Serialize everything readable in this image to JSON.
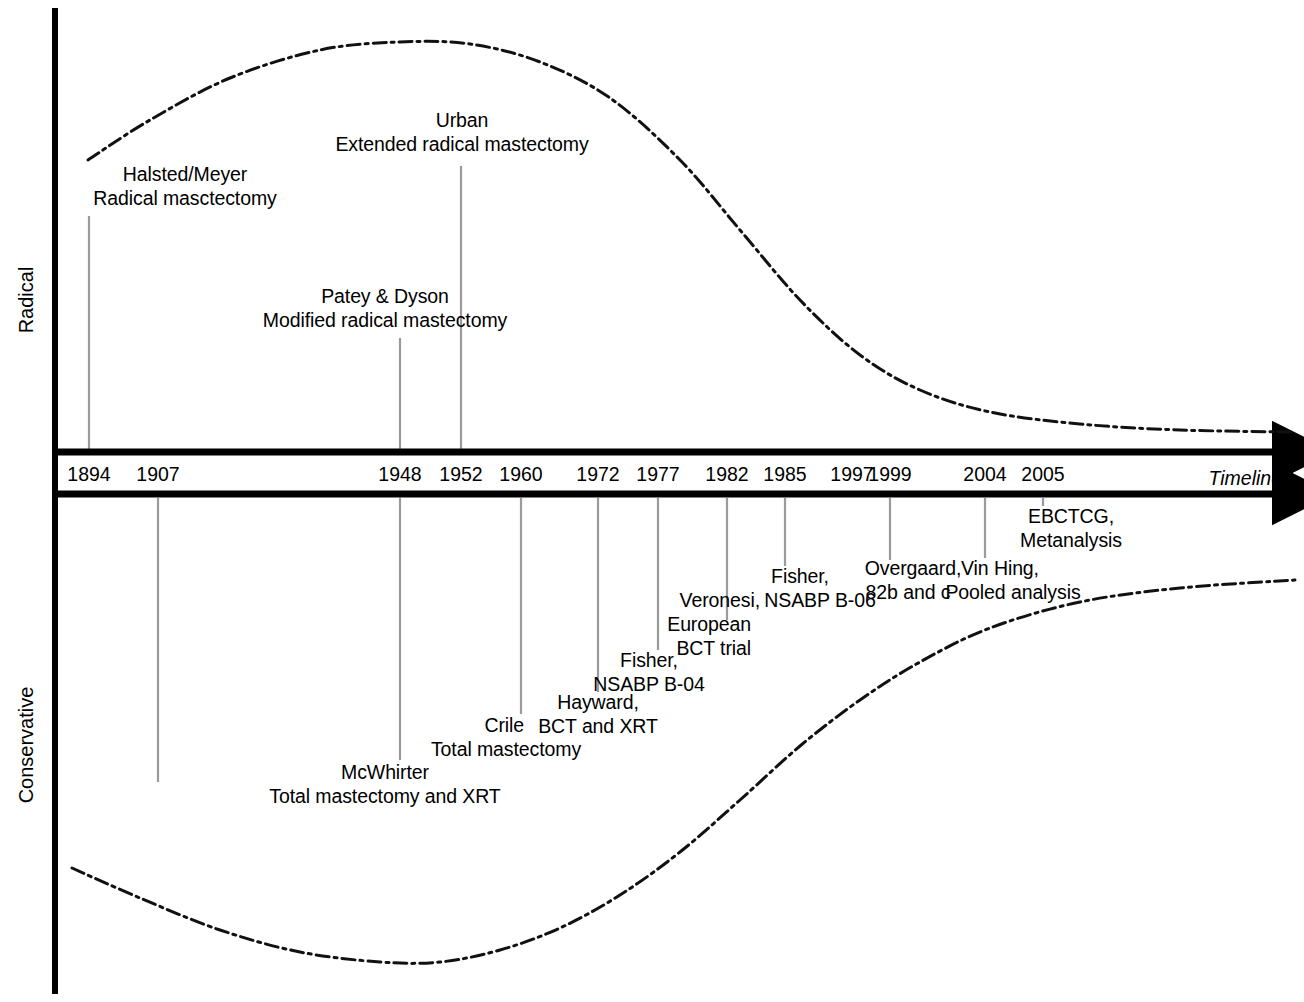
{
  "figure": {
    "type": "timeline",
    "axis_labels": {
      "top_region": "Radical",
      "bottom_region": "Conservative",
      "x_axis": "Timeline"
    },
    "colors": {
      "ink": "#000000",
      "leader_line": "#9a9a9a",
      "background": "#ffffff"
    }
  },
  "years": [
    {
      "label": "1894",
      "x": 89
    },
    {
      "label": "1907",
      "x": 158
    },
    {
      "label": "1948",
      "x": 400
    },
    {
      "label": "1952",
      "x": 461
    },
    {
      "label": "1960",
      "x": 521
    },
    {
      "label": "1972",
      "x": 598
    },
    {
      "label": "1977",
      "x": 658
    },
    {
      "label": "1982",
      "x": 727
    },
    {
      "label": "1985",
      "x": 785
    },
    {
      "label": "1997",
      "x": 852
    },
    {
      "label": "1999",
      "x": 890
    },
    {
      "label": "2004",
      "x": 985
    },
    {
      "label": "2005",
      "x": 1043
    }
  ],
  "radical_events": [
    {
      "name": "halsted-meyer",
      "year": "1894",
      "line1": "Halsted/Meyer",
      "line2": "Radical masctectomy"
    },
    {
      "name": "urban",
      "year": "1952",
      "line1": "Urban",
      "line2": "Extended radical mastectomy"
    },
    {
      "name": "patey-dyson",
      "year": "1948",
      "line1": "Patey & Dyson",
      "line2": "Modified radical mastectomy"
    }
  ],
  "conservative_events": [
    {
      "name": "mcwhirter",
      "year": "1907",
      "line1": "McWhirter",
      "line2": "Total mastectomy and XRT"
    },
    {
      "name": "crile",
      "year": "1948",
      "line1": "Crile",
      "line2": "Total mastectomy"
    },
    {
      "name": "hayward",
      "year": "1960",
      "line1": "Hayward,",
      "line2": "BCT and XRT"
    },
    {
      "name": "fisher-b04",
      "year": "1972",
      "line1": "Fisher,",
      "line2": "NSABP B-04"
    },
    {
      "name": "veronesi",
      "year": "1977",
      "line1": "Veronesi,",
      "line2": "European",
      "line3": "BCT trial"
    },
    {
      "name": "fisher-b06",
      "year": "1985",
      "line1": "Fisher,",
      "line2": "NSABP B-06"
    },
    {
      "name": "overgaard",
      "year": "1999",
      "line1": "Overgaard,",
      "line2": "82b and c"
    },
    {
      "name": "vin-hing",
      "year": "2004",
      "line1": "Vin Hing,",
      "line2": "Pooled analysis"
    },
    {
      "name": "ebctcg",
      "year": "2005",
      "line1": "EBCTCG,",
      "line2": "Metanalysis"
    }
  ],
  "curves": {
    "radical": {
      "name": "radical-trend-curve",
      "style": "dash-dot",
      "description": "Rises from 1894, peaks circa 1950, declines steeply after 1970 and flattens near zero by 2005",
      "points": [
        [
          88,
          160
        ],
        [
          150,
          120
        ],
        [
          230,
          78
        ],
        [
          320,
          50
        ],
        [
          400,
          42
        ],
        [
          470,
          44
        ],
        [
          540,
          62
        ],
        [
          610,
          98
        ],
        [
          680,
          160
        ],
        [
          740,
          230
        ],
        [
          800,
          300
        ],
        [
          860,
          355
        ],
        [
          920,
          390
        ],
        [
          990,
          412
        ],
        [
          1080,
          424
        ],
        [
          1180,
          430
        ],
        [
          1295,
          432
        ]
      ]
    },
    "conservative": {
      "name": "conservative-trend-curve",
      "style": "dash-dot",
      "description": "Declines slightly to a minimum circa 1948, then rises steadily through the 1970s-1990s and plateaus high by 2005",
      "points": [
        [
          72,
          868
        ],
        [
          140,
          898
        ],
        [
          220,
          930
        ],
        [
          300,
          952
        ],
        [
          380,
          962
        ],
        [
          440,
          962
        ],
        [
          500,
          950
        ],
        [
          560,
          928
        ],
        [
          620,
          895
        ],
        [
          680,
          852
        ],
        [
          740,
          800
        ],
        [
          800,
          746
        ],
        [
          860,
          700
        ],
        [
          920,
          662
        ],
        [
          990,
          628
        ],
        [
          1080,
          602
        ],
        [
          1180,
          588
        ],
        [
          1295,
          580
        ]
      ]
    }
  }
}
